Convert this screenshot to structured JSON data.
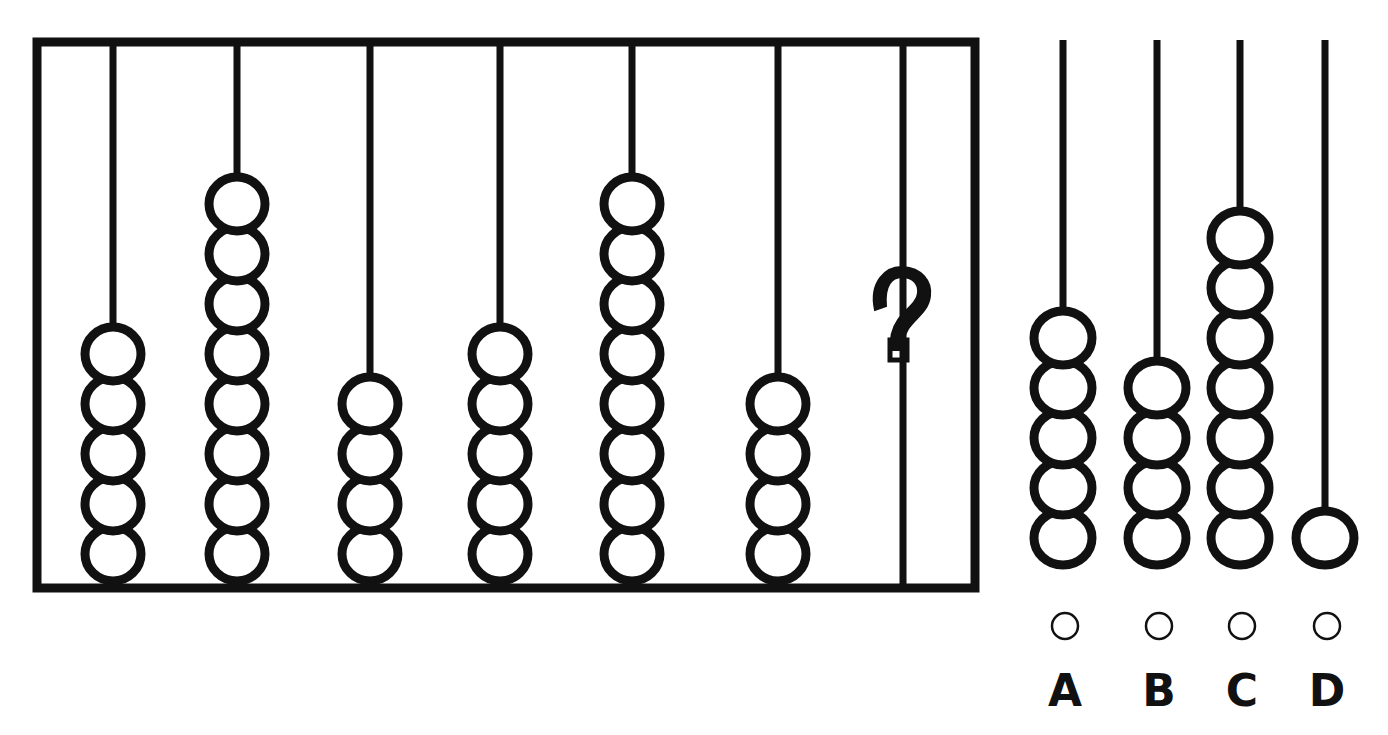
{
  "puzzle": {
    "type": "abacus-sequence-pattern",
    "title": "Abacus bead-count sequence puzzle",
    "question_mark": "?",
    "stroke_color": "#111111",
    "background_color": "#ffffff",
    "bead_fill": "#ffffff"
  },
  "sequence_frame": {
    "name": "abacus-frame",
    "border_color": "#111111",
    "rods": [
      {
        "index": 1,
        "bead_count": 5,
        "label": "rod-1"
      },
      {
        "index": 2,
        "bead_count": 8,
        "label": "rod-2"
      },
      {
        "index": 3,
        "bead_count": 4,
        "label": "rod-3"
      },
      {
        "index": 4,
        "bead_count": 5,
        "label": "rod-4"
      },
      {
        "index": 5,
        "bead_count": 8,
        "label": "rod-5"
      },
      {
        "index": 6,
        "bead_count": 4,
        "label": "rod-6"
      },
      {
        "index": 7,
        "bead_count": 0,
        "label": "rod-7-unknown",
        "unknown": true
      }
    ]
  },
  "options": [
    {
      "letter": "A",
      "bead_count": 5
    },
    {
      "letter": "B",
      "bead_count": 4
    },
    {
      "letter": "C",
      "bead_count": 7
    },
    {
      "letter": "D",
      "bead_count": 1
    }
  ],
  "chart_data": {
    "type": "bar",
    "categories": [
      "1",
      "2",
      "3",
      "4",
      "5",
      "6",
      "7"
    ],
    "values": [
      5,
      8,
      4,
      5,
      8,
      4,
      0
    ],
    "option_categories": [
      "A",
      "B",
      "C",
      "D"
    ],
    "option_values": [
      5,
      4,
      7,
      1
    ],
    "xlabel": "Rod",
    "ylabel": "Beads",
    "ylim": [
      0,
      8
    ]
  }
}
